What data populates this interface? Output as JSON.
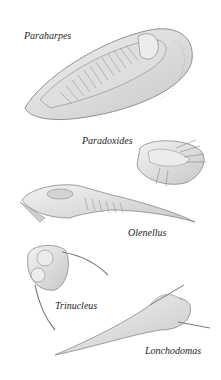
{
  "figure": {
    "specimens": [
      {
        "name": "Paraharpes"
      },
      {
        "name": "Paradoxides"
      },
      {
        "name": "Olenellus"
      },
      {
        "name": "Trinucleus"
      },
      {
        "name": "Lonchodomas"
      }
    ]
  },
  "colors": {
    "background": "#ffffff",
    "body_fill": "#e6e6e6",
    "shadow": "#bdbdbd",
    "outline": "#7a7a7a",
    "label_text": "#1e1e1e"
  }
}
